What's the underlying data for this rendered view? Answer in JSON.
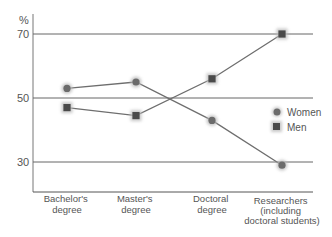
{
  "chart_data": {
    "type": "line",
    "title": "",
    "xlabel": "",
    "ylabel": "%",
    "ylim": [
      20,
      75
    ],
    "yticks": [
      30,
      50,
      70
    ],
    "grid": true,
    "legend_position": "right",
    "categories": [
      "Bachelor's degree",
      "Master's degree",
      "Doctoral degree",
      "Researchers (including doctoral students)"
    ],
    "category_lines": [
      [
        "Bachelor's",
        "degree"
      ],
      [
        "Master's",
        "degree"
      ],
      [
        "Doctoral",
        "degree"
      ],
      [
        "Researchers",
        "(including",
        "doctoral students)"
      ]
    ],
    "series": [
      {
        "name": "Women",
        "marker": "circle",
        "color": "#6b6b6b",
        "values": [
          53,
          55,
          43,
          29
        ]
      },
      {
        "name": "Men",
        "marker": "square",
        "color": "#4a4a4a",
        "values": [
          47,
          44.5,
          56,
          70
        ]
      }
    ]
  },
  "axis": {
    "unit_label": "%",
    "tick_labels": [
      "70",
      "50",
      "30"
    ]
  },
  "legend": {
    "women_label": "Women",
    "men_label": "Men"
  }
}
